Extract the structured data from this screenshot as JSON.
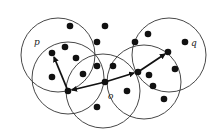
{
  "diagram": {
    "type": "density-reachability",
    "colors": {
      "stroke": "#333333",
      "point": "#111111",
      "background": "#ffffff"
    },
    "circles": [
      {
        "id": "c-p",
        "cx": 58,
        "cy": 55,
        "r": 37
      },
      {
        "id": "c-left",
        "cx": 68,
        "cy": 78,
        "r": 36
      },
      {
        "id": "c-center",
        "cx": 103,
        "cy": 91,
        "r": 37
      },
      {
        "id": "c-right",
        "cx": 144,
        "cy": 82,
        "r": 37
      },
      {
        "id": "c-q",
        "cx": 169,
        "cy": 55,
        "r": 37
      }
    ],
    "points": [
      [
        70,
        26
      ],
      [
        105,
        26
      ],
      [
        97,
        42
      ],
      [
        65,
        47
      ],
      [
        52,
        53
      ],
      [
        76,
        58
      ],
      [
        52,
        77
      ],
      [
        83,
        74
      ],
      [
        97,
        66
      ],
      [
        68,
        91
      ],
      [
        105,
        82
      ],
      [
        113,
        66
      ],
      [
        127,
        91
      ],
      [
        97,
        107
      ],
      [
        135,
        42
      ],
      [
        148,
        34
      ],
      [
        185,
        42
      ],
      [
        168,
        52
      ],
      [
        138,
        72
      ],
      [
        149,
        75
      ],
      [
        175,
        69
      ],
      [
        153,
        86
      ],
      [
        164,
        99
      ]
    ],
    "arrows": [
      {
        "from": [
          68,
          91
        ],
        "to": [
          54,
          57
        ]
      },
      {
        "from": [
          105,
          82
        ],
        "to": [
          72,
          90
        ]
      },
      {
        "from": [
          105,
          82
        ],
        "to": [
          134,
          73
        ]
      },
      {
        "from": [
          138,
          72
        ],
        "to": [
          165,
          54
        ]
      }
    ],
    "labels": [
      {
        "text": "p",
        "x": 34,
        "y": 45
      },
      {
        "text": "o",
        "x": 108,
        "y": 99
      },
      {
        "text": "q",
        "x": 191,
        "y": 46
      }
    ]
  }
}
